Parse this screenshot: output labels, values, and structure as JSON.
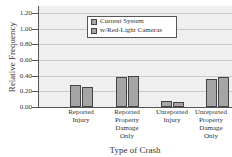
{
  "chart_data": {
    "type": "bar",
    "title": "",
    "xlabel": "Type of Crash",
    "ylabel": "Relative Frequency",
    "ylim": [
      0,
      1.2
    ],
    "yticks": [
      "0.00",
      "0.20",
      "0.40",
      "0.60",
      "0.80",
      "1.00",
      "1.20"
    ],
    "grid": true,
    "legend_position": "upper center",
    "categories": [
      "Reported Injury",
      "Reported Property Damage Only",
      "Unreported Injury",
      "Unreported Property Damage Only"
    ],
    "category_lines": [
      [
        "Reported",
        "Injury"
      ],
      [
        "Reported",
        "Property",
        "Damage",
        "Only"
      ],
      [
        "Unreported",
        "Injury"
      ],
      [
        "Unreported",
        "Property",
        "Damage",
        "Only"
      ]
    ],
    "series": [
      {
        "name": "Current System",
        "values": [
          0.28,
          0.38,
          0.08,
          0.36
        ]
      },
      {
        "name": "w/Red-Light Cameras",
        "values": [
          0.25,
          0.39,
          0.07,
          0.38
        ]
      }
    ],
    "colors": {
      "bar": "#a5a5a5",
      "plot_bg": "#efefef",
      "grid": "#c9c9c9"
    }
  }
}
